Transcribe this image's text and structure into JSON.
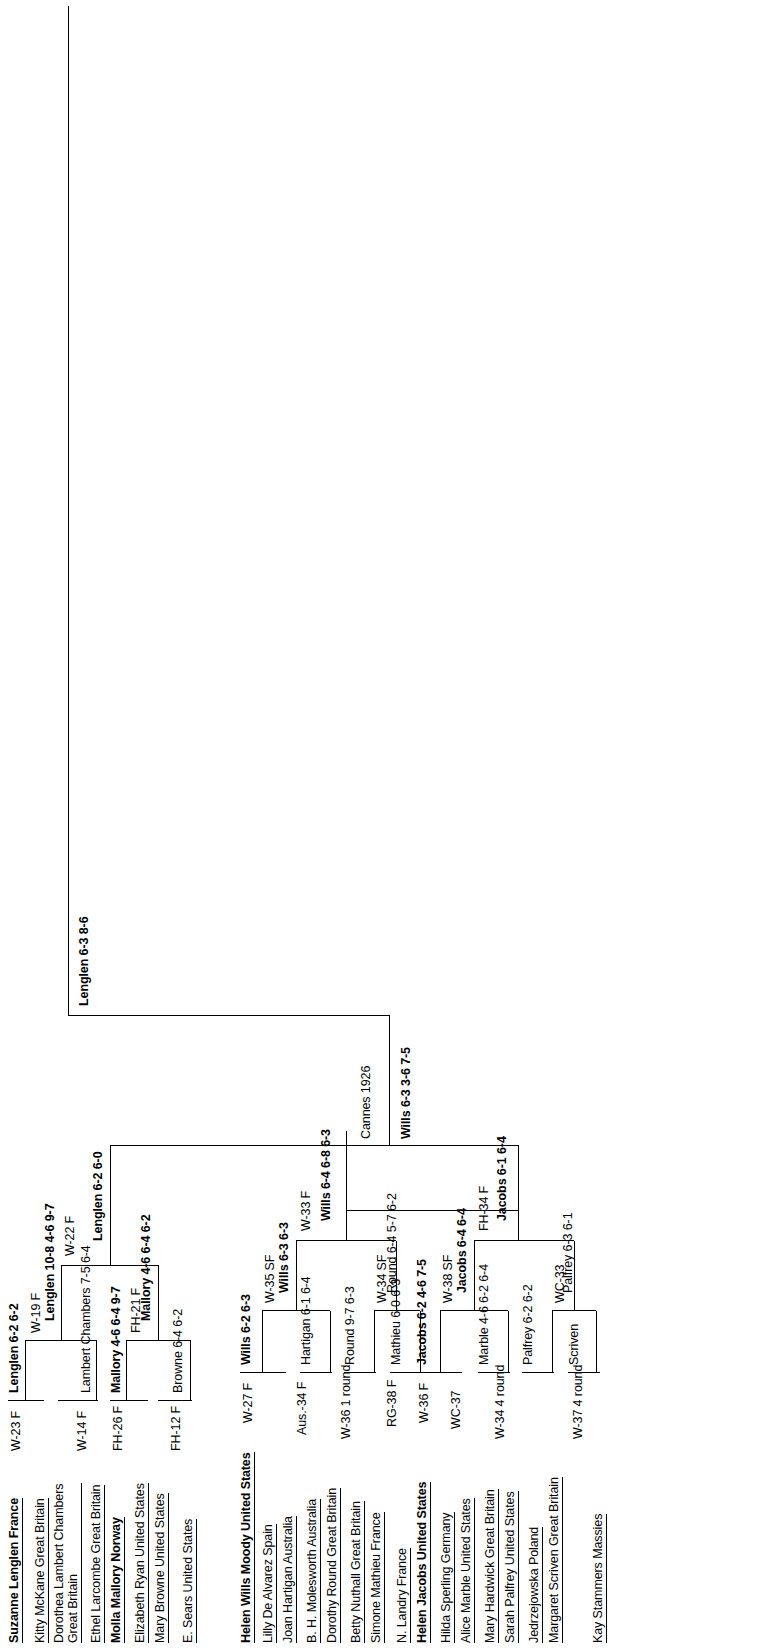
{
  "diagram": {
    "type": "tournament-bracket",
    "sport": "tennis",
    "orientation": "rotated-90-ccw",
    "center_note": "Cannes 1926",
    "champion_line": "Lenglen 6-3 8-6"
  },
  "top_half": {
    "seed_a": {
      "name": "Suzanne Lenglen France",
      "tag": "W-23 F"
    },
    "r1": [
      {
        "player": "Kitty McKane Great Britain",
        "tag": ""
      },
      {
        "player": "Dorothea Lambert Chambers Great Britain",
        "tag": ""
      },
      {
        "player": "Ethel Larcombe Great Britain",
        "tag": "W-14 F"
      }
    ],
    "seed_b": {
      "name": "Molla Mallory Norway",
      "tag": "FH-26 F"
    },
    "r1b": [
      {
        "player": "Elizabeth Ryan United States",
        "tag": ""
      },
      {
        "player": "Mary Browne United States",
        "tag": ""
      },
      {
        "player": "E. Sears United States",
        "tag": "FH-12 F"
      }
    ],
    "r2_results": [
      "Lenglen 6-2 6-2",
      "Lambert Chambers 7-5 6-4",
      "Mallory 4-6 6-4 9-7",
      "Browne 6-4 6-2"
    ],
    "r3_results": [
      "Lenglen 10-8 4-6 9-7",
      "Mallory 4-6 6-4 6-2"
    ],
    "r3_tags": [
      "W-19 F",
      "FH-21 F"
    ],
    "r4_result": "Lenglen 6-2 6-0",
    "r4_tag": "W-22 F"
  },
  "bottom_half": {
    "seed_a": {
      "name": "Helen Wills Moody United States",
      "tag": "W-27 F"
    },
    "r1": [
      {
        "player": "Lilly De Alvarez Spain",
        "tag": ""
      },
      {
        "player": "Joan Hartigan Australia",
        "tag": ""
      },
      {
        "player": "B. H. Molesworth Australia",
        "tag": "Aus.-34 F"
      },
      {
        "player": "Dorothy Round Great Britain",
        "tag": ""
      },
      {
        "player": "Betty Nuthall Great Britain",
        "tag": "W-36 1 round"
      },
      {
        "player": "Simone Mathieu France",
        "tag": ""
      },
      {
        "player": "N. Landry France",
        "tag": "RG-38 F"
      }
    ],
    "seed_b": {
      "name": "Helen Jacobs United States",
      "tag": "W-36 F"
    },
    "r1b": [
      {
        "player": "Hilda Sperling Germany",
        "tag": ""
      },
      {
        "player": "Alice Marble United States",
        "tag": "WC-37"
      },
      {
        "player": "Mary Hardwick Great Britain",
        "tag": ""
      },
      {
        "player": "Sarah Palfrey United States",
        "tag": "W-34 4 round"
      },
      {
        "player": "Jedrzejowska Poland",
        "tag": ""
      },
      {
        "player": "Margaret Scriven Great Britain",
        "tag": "W-37 4 round"
      },
      {
        "player": "Kay Stammers Massies",
        "tag": ""
      }
    ],
    "r2_results": [
      "Wills 6-2 6-3",
      "Hartigan 6-1 6-4",
      "Round 9-7 6-3",
      "Mathieu 6-0 6-3",
      "Jacobs 6-2 4-6 7-5",
      "Marble 4-6 6-2 6-4",
      "Palfrey 6-2 6-2",
      "Scriven"
    ],
    "r3_results": [
      "Wills 6-3 6-3",
      "Round 6-4 5-7 6-2",
      "Jacobs 6-4 6-4",
      "Palfrey 6-3 6-1"
    ],
    "r3_tags": [
      "W-35 SF",
      "W-34 SF",
      "W-38 SF",
      "WC-33"
    ],
    "r4_results": [
      "Wills 6-4 6-8 6-3",
      "Jacobs 6-1 6-4"
    ],
    "r4_tags": [
      "W-33 F",
      "FH-34 F"
    ],
    "r5_result": "Wills 6-3 3-6 7-5"
  }
}
